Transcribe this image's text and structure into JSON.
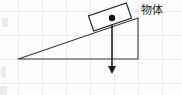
{
  "figure": {
    "canvas": {
      "width": 182,
      "height": 95,
      "background": "#fdfdfd"
    },
    "grid": {
      "visible": true,
      "color": "#eceef0",
      "spacing": 24,
      "origin_x": 18,
      "origin_y": 11
    },
    "labels": [
      {
        "id": "object-label",
        "text": "物体",
        "x": 141,
        "y": 11,
        "font_size": 11,
        "color": "#1a1a1a"
      }
    ],
    "incline": {
      "name": "inclined-plane",
      "color": "#3a3a3a",
      "stroke_width": 1.1,
      "apex": {
        "x": 18,
        "y": 59
      },
      "base_right": {
        "x": 138,
        "y": 59
      },
      "top_right": {
        "x": 138,
        "y": 18
      },
      "angle_degrees": 19,
      "points": "18,59 138,59 138,18 18,59"
    },
    "block": {
      "name": "object-block",
      "color": "#2b2b2b",
      "fill": "#ffffff",
      "stroke_width": 1.2,
      "center": {
        "x": 110,
        "y": 17
      },
      "width": 40,
      "height": 16,
      "rotation_degrees": -19
    },
    "center_of_mass": {
      "name": "center-of-mass-dot",
      "x": 112,
      "y": 18,
      "radius": 3.2,
      "color": "#111111"
    },
    "gravity_vector": {
      "name": "gravity-vector",
      "color": "#1c1c1c",
      "stroke_width": 1.6,
      "start": {
        "x": 112,
        "y": 18
      },
      "end": {
        "x": 112,
        "y": 66
      },
      "arrow_tip": {
        "x": 112,
        "y": 74
      },
      "arrow_half_width": 4,
      "direction": "down"
    }
  }
}
